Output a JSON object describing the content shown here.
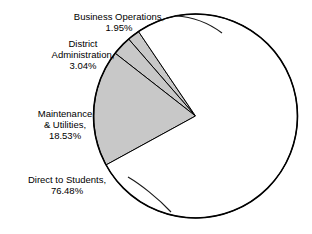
{
  "chart_data": {
    "type": "pie",
    "title": "",
    "subtitle": "",
    "xlabel": "",
    "ylabel": "",
    "grid": false,
    "legend_position": "none",
    "label_format": "{name}, {value}%",
    "total": 100.0,
    "categories": [
      "Business Operations",
      "District Administration",
      "Maintenance & Utilities",
      "Direct to Students"
    ],
    "values": [
      1.95,
      3.04,
      18.53,
      76.48
    ],
    "slices": [
      {
        "name": "Business Operations",
        "value": 1.95,
        "value_text": "1.95%",
        "label_text": "Business Operations,\n1.95%",
        "fill": "#c8c8c8",
        "stroke": "#000000",
        "start_angle_deg": 124.0,
        "end_angle_deg": 131.0
      },
      {
        "name": "District Administration",
        "value": 3.04,
        "value_text": "3.04%",
        "label_text": "District\nAdministration,\n3.04%",
        "fill": "#c8c8c8",
        "stroke": "#000000",
        "start_angle_deg": 131.0,
        "end_angle_deg": 142.0
      },
      {
        "name": "Maintenance & Utilities",
        "value": 18.53,
        "value_text": "18.53%",
        "label_text": "Maintenance\n& Utilities,\n18.53%",
        "fill": "#c8c8c8",
        "stroke": "#000000",
        "start_angle_deg": 142.0,
        "end_angle_deg": 208.7
      },
      {
        "name": "Direct to Students",
        "value": 76.48,
        "value_text": "76.48%",
        "label_text": "Direct to Students,\n76.48%",
        "fill": "#ffffff",
        "stroke": "#000000",
        "start_angle_deg": 208.7,
        "end_angle_deg": 484.0
      }
    ],
    "geometry": {
      "center_x": 195.5,
      "center_y": 116.0,
      "radius": 102.0,
      "outline_color": "#000000",
      "outline_width": 1.6,
      "slice_border_width": 1.0
    },
    "colors": {
      "gray_fill": "#c8c8c8",
      "white_fill": "#ffffff",
      "outline": "#000000",
      "text": "#000000",
      "background": "#ffffff"
    }
  }
}
